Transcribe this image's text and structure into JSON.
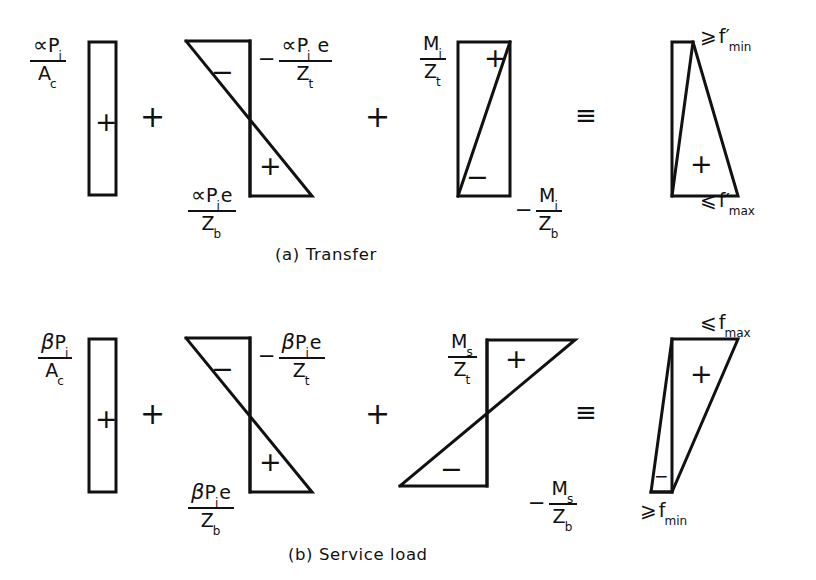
{
  "figure": {
    "line_color": "#111111",
    "background": "#ffffff",
    "rows": [
      {
        "id": "row-a",
        "caption": "(a)  Transfer",
        "operators": [
          "+",
          "+",
          "≡"
        ],
        "terms": [
          {
            "id": "axial-transfer",
            "shape": "rectangle",
            "sign": "+",
            "label_top_left": {
              "numerator": "∝P",
              "numerator_sub": "i",
              "denominator": "A",
              "denominator_sub": "c"
            }
          },
          {
            "id": "eccentric-transfer",
            "shape": "bowtie",
            "sign_top": "−",
            "sign_bottom": "+",
            "label_top_right": {
              "prefix": "−",
              "numerator": "∝P",
              "numerator_sub": "i",
              "numerator_tail": "e",
              "denominator": "Z",
              "denominator_sub": "t"
            },
            "label_bottom_left": {
              "prefix": "",
              "numerator": "∝P",
              "numerator_sub": "i",
              "numerator_tail": "e",
              "denominator": "Z",
              "denominator_sub": "b"
            }
          },
          {
            "id": "moment-transfer",
            "shape": "bowtie-narrow",
            "sign_top": "+",
            "sign_bottom": "−",
            "label_top_left": {
              "prefix": "",
              "numerator": "M",
              "numerator_sub": "i",
              "denominator": "Z",
              "denominator_sub": "t"
            },
            "label_bottom_right": {
              "prefix": "−",
              "numerator": "M",
              "numerator_sub": "i",
              "denominator": "Z",
              "denominator_sub": "b"
            }
          },
          {
            "id": "result-transfer",
            "shape": "triangle-notch-top",
            "sign": "+",
            "label_top": {
              "relation": "⩾",
              "symbol": "f",
              "prime": "′",
              "sub": "min"
            },
            "label_bottom": {
              "relation": "⩽",
              "symbol": "f",
              "prime": "′",
              "sub": "max"
            }
          }
        ]
      },
      {
        "id": "row-b",
        "caption": "(b) Service   load",
        "operators": [
          "+",
          "+",
          "≡"
        ],
        "terms": [
          {
            "id": "axial-service",
            "shape": "rectangle",
            "sign": "+",
            "label_top_left": {
              "numerator": "βP",
              "numerator_sub": "i",
              "denominator": "A",
              "denominator_sub": "c"
            }
          },
          {
            "id": "eccentric-service",
            "shape": "bowtie",
            "sign_top": "−",
            "sign_bottom": "+",
            "label_top_right": {
              "prefix": "−",
              "numerator": "βP",
              "numerator_sub": "i",
              "numerator_tail": "e",
              "denominator": "Z",
              "denominator_sub": "t"
            },
            "label_bottom_left": {
              "prefix": "",
              "numerator": "βP",
              "numerator_sub": "i",
              "numerator_tail": "e",
              "denominator": "Z",
              "denominator_sub": "b"
            }
          },
          {
            "id": "moment-service",
            "shape": "bowtie-wide-mirror",
            "sign_top": "+",
            "sign_bottom": "−",
            "label_top_left": {
              "prefix": "",
              "numerator": "M",
              "numerator_sub": "s",
              "denominator": "Z",
              "denominator_sub": "t"
            },
            "label_bottom_right": {
              "prefix": "−",
              "numerator": "M",
              "numerator_sub": "s",
              "denominator": "Z",
              "denominator_sub": "b"
            }
          },
          {
            "id": "result-service",
            "shape": "triangle-notch-bottom",
            "sign": "+",
            "label_top": {
              "relation": "⩽",
              "symbol": "f",
              "prime": "",
              "sub": "max"
            },
            "label_bottom": {
              "relation": "⩾",
              "symbol": "f",
              "prime": "",
              "sub": "min"
            }
          }
        ]
      }
    ]
  }
}
